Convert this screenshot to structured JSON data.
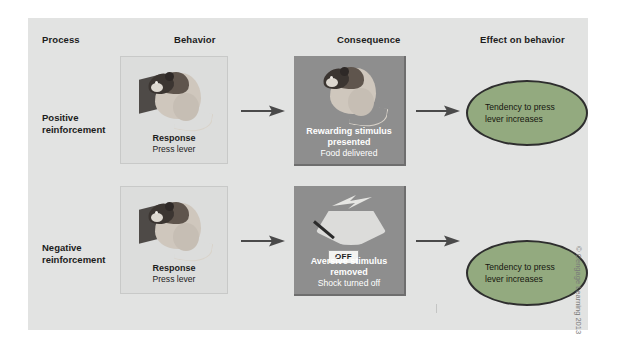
{
  "figure": {
    "headers": [
      {
        "id": "process",
        "label": "Process"
      },
      {
        "id": "behavior",
        "label": "Behavior"
      },
      {
        "id": "consequence",
        "label": "Consequence"
      },
      {
        "id": "effect",
        "label": "Effect on behavior"
      }
    ],
    "rows": [
      {
        "process_label": "Positive\nreinforcement",
        "behavior": {
          "title": "Response",
          "sub": "Press lever",
          "icon": "rat-pressing-lever-icon"
        },
        "consequence": {
          "title_line1": "Rewarding stimulus",
          "title_line2": "presented",
          "sub": "Food delivered",
          "icon": "rat-with-food-icon"
        },
        "effect": {
          "text": "Tendency to press lever increases"
        }
      },
      {
        "process_label": "Negative\nreinforcement",
        "behavior": {
          "title": "Response",
          "sub": "Press lever",
          "icon": "rat-pressing-lever-icon"
        },
        "consequence": {
          "title_line1": "Aversive stimulus",
          "title_line2": "removed",
          "sub": "Shock turned off",
          "icon": "lightning-bolt-icon",
          "switch_label": "OFF"
        },
        "effect": {
          "text": "Tendency to press lever increases"
        }
      }
    ],
    "credit": "© Cengage Learning 2013",
    "colors": {
      "panel_background": "#e2e3e2",
      "behavior_panel": "#dcdddc",
      "consequence_panel": "#8e8e8e",
      "effect_oval": "#93aa7f",
      "arrow": "#4a4a4a",
      "text": "#1c1c1c"
    }
  }
}
